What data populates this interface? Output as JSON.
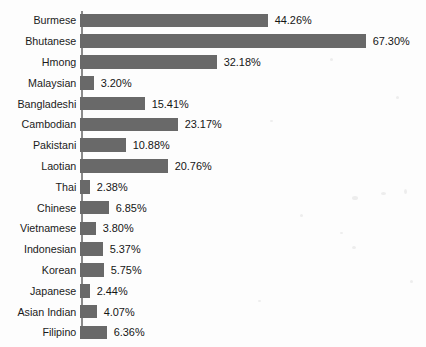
{
  "figure": {
    "title_remnant": "",
    "background_color": "#fdfdfd",
    "bar_color": "#696969",
    "axis_color": "#8a8a8a",
    "text_color": "#1b1b1b"
  },
  "chart_data": {
    "type": "bar",
    "orientation": "horizontal",
    "title": "",
    "subtitle": "",
    "xlabel": "",
    "ylabel": "",
    "xlim": [
      0,
      67.3
    ],
    "grid": false,
    "legend": null,
    "value_format": "percent",
    "value_suffix": "%",
    "categories": [
      "Burmese",
      "Bhutanese",
      "Hmong",
      "Malaysian",
      "Bangladeshi",
      "Cambodian",
      "Pakistani",
      "Laotian",
      "Thai",
      "Chinese",
      "Vietnamese",
      "Indonesian",
      "Korean",
      "Japanese",
      "Asian Indian",
      "Filipino"
    ],
    "values": [
      44.26,
      67.3,
      32.18,
      3.2,
      15.41,
      23.17,
      10.88,
      20.76,
      2.38,
      6.85,
      3.8,
      5.37,
      5.75,
      2.44,
      4.07,
      6.36
    ],
    "value_labels": [
      "44.26%",
      "67.30%",
      "32.18%",
      "3.20%",
      "15.41%",
      "23.17%",
      "10.88%",
      "20.76%",
      "2.38%",
      "6.85%",
      "3.80%",
      "5.37%",
      "5.75%",
      "2.44%",
      "4.07%",
      "6.36%"
    ]
  }
}
